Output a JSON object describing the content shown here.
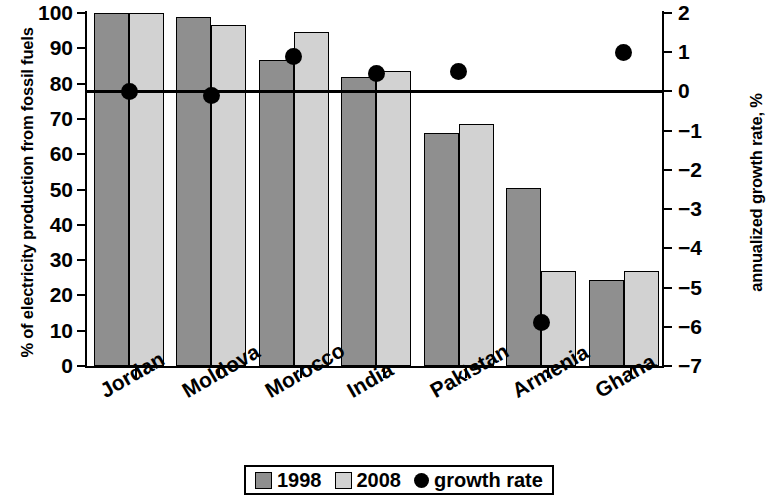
{
  "chart_data": {
    "type": "bar",
    "title": "",
    "subtitle": "",
    "categories": [
      "Jordan",
      "Moldova",
      "Morocco",
      "India",
      "Pakistan",
      "Armenia",
      "Ghana"
    ],
    "xlabel": "",
    "ylabel": "% of electricity production from fossil fuels",
    "y2label": "annualized growth rate, %",
    "ylim": [
      0,
      100
    ],
    "y2lim": [
      -7,
      2
    ],
    "yticks": [
      0,
      10,
      20,
      30,
      40,
      50,
      60,
      70,
      80,
      90,
      100
    ],
    "y2ticks": [
      2,
      1,
      0,
      -1,
      -2,
      -3,
      -4,
      -5,
      -6,
      -7
    ],
    "yticklabels": [
      "0",
      "10",
      "20",
      "30",
      "40",
      "50",
      "60",
      "70",
      "80",
      "90",
      "100"
    ],
    "y2ticklabels": [
      "2",
      "1",
      "0",
      "−1",
      "−2",
      "−3",
      "−4",
      "−5",
      "−6",
      "−7"
    ],
    "grid": false,
    "legend_position": "bottom-center",
    "zero_reference_line": 0,
    "series": [
      {
        "name": "1998",
        "axis": "left",
        "kind": "bar",
        "color": "#8f8f8f",
        "values": [
          100,
          99,
          86.7,
          82,
          66,
          50.5,
          24.5
        ]
      },
      {
        "name": "2008",
        "axis": "left",
        "kind": "bar",
        "color": "#d2d2d2",
        "values": [
          100,
          96.5,
          94.5,
          83.5,
          68.5,
          27,
          27
        ]
      },
      {
        "name": "growth rate",
        "axis": "right",
        "kind": "scatter",
        "color": "#000000",
        "values": [
          0.0,
          -0.1,
          0.9,
          0.45,
          0.5,
          -5.9,
          1.0
        ]
      }
    ]
  },
  "legend": {
    "entries": [
      {
        "label": "1998",
        "swatch": "dark-gray-square-icon"
      },
      {
        "label": "2008",
        "swatch": "light-gray-square-icon"
      },
      {
        "label": "growth rate",
        "swatch": "black-circle-icon"
      }
    ]
  }
}
